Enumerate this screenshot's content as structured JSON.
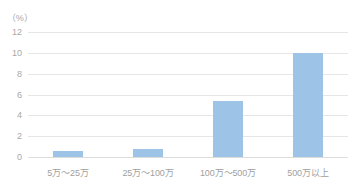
{
  "chart_data": {
    "type": "bar",
    "title": "",
    "subtitle": "",
    "xlabel": "",
    "ylabel": "",
    "unit_label": "（%）",
    "categories": [
      "5万～25万",
      "25万～100万",
      "100万～500万",
      "500万以上"
    ],
    "values": [
      0.6,
      0.8,
      5.4,
      10.0
    ],
    "series": [
      {
        "name": "割合",
        "values": [
          0.6,
          0.8,
          5.4,
          10.0
        ]
      }
    ],
    "ylim": [
      0,
      12
    ],
    "ytick_step": 2,
    "yticks": [
      "12",
      "10",
      "8",
      "6",
      "4",
      "2",
      "0"
    ],
    "ytick_values": [
      12,
      10,
      8,
      6,
      4,
      2,
      0
    ],
    "grid": true,
    "grid_axis": "y",
    "legend": false,
    "legend_position": "none",
    "bar_color": "#9dc3e6",
    "grid_color": "#e6e6e6",
    "axis_color": "#dddddd",
    "tick_text_color": "#a8a8a8",
    "category_text_color": "#9f9f9f",
    "background_color": "#ffffff"
  }
}
